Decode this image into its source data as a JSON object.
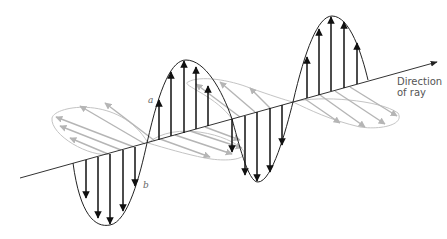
{
  "figure": {
    "labels": {
      "direction_line1": "Direction",
      "direction_line2": "of ray",
      "point_a": "a",
      "point_b": "b"
    },
    "colors": {
      "axis": "#333333",
      "vertical_wave": "#111111",
      "horizontal_wave": "#b8b8b8"
    },
    "axis": {
      "start": [
        20,
        178
      ],
      "end": [
        437,
        62
      ]
    },
    "vertical_lobes": [
      {
        "direction": "down",
        "x_start": 73,
        "x_end": 147,
        "peak_y": 225
      },
      {
        "direction": "up",
        "x_start": 147,
        "x_end": 232,
        "peak_y": 60
      },
      {
        "direction": "down",
        "x_start": 232,
        "x_end": 293,
        "peak_y": 182
      },
      {
        "direction": "up",
        "x_start": 293,
        "x_end": 368,
        "peak_y": 16
      }
    ]
  }
}
